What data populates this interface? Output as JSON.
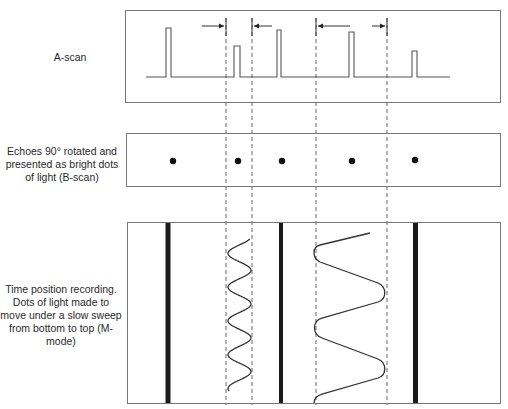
{
  "panels": {
    "a_scan": {
      "label": "A-scan",
      "pulses": [
        {
          "name": "echo-1",
          "relative_height": 0.98
        },
        {
          "name": "echo-2",
          "relative_height": 0.62
        },
        {
          "name": "echo-3",
          "relative_height": 0.94
        },
        {
          "name": "echo-4",
          "relative_height": 0.9
        },
        {
          "name": "echo-5",
          "relative_height": 0.52
        }
      ],
      "motion_arrows": [
        {
          "name": "arrow-right-1",
          "direction": "right"
        },
        {
          "name": "arrow-left-1",
          "direction": "left"
        },
        {
          "name": "arrow-left-2",
          "direction": "left"
        },
        {
          "name": "arrow-right-2",
          "direction": "right"
        }
      ]
    },
    "b_scan": {
      "label": "Echoes 90° rotated and presented as bright dots of light (B-scan)",
      "dots": 5
    },
    "m_mode": {
      "label": "Time position recording. Dots of light made to move under a slow sweep from bottom to top (M-mode)",
      "static_bars": 3,
      "moving_traces": [
        {
          "name": "trace-small",
          "cycles": 4.5
        },
        {
          "name": "trace-large",
          "cycles": 3
        }
      ]
    }
  },
  "colors": {
    "line": "#555555",
    "ink": "#111111",
    "frame": "#777777"
  }
}
